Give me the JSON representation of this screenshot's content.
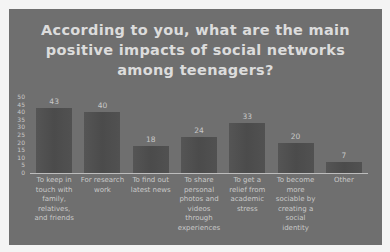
{
  "chart_data": {
    "type": "bar",
    "title": "According to you, what are the main positive impacts of social networks among teenagers?",
    "title_lines": [
      "According to you, what are the main",
      "positive impacts of social networks",
      "among teenagers?"
    ],
    "categories": [
      "To keep in touch with family, relatives, and friends",
      "For research work",
      "To find out latest news",
      "To share personal photos and videos through experiences",
      "To get a relief from academic stress",
      "To become more sociable by creating a social identity",
      "Other"
    ],
    "category_lines": [
      [
        "To keep in",
        "touch with",
        "family,",
        "relatives,",
        "and friends"
      ],
      [
        "For research",
        "work"
      ],
      [
        "To find out",
        "latest news"
      ],
      [
        "To share",
        "personal",
        "photos and",
        "videos",
        "through",
        "experiences"
      ],
      [
        "To get a",
        "relief from",
        "academic",
        "stress"
      ],
      [
        "To become",
        "more",
        "sociable by",
        "creating a",
        "social",
        "identity"
      ],
      [
        "Other"
      ]
    ],
    "values": [
      43,
      40,
      18,
      24,
      33,
      20,
      7
    ],
    "xlabel": "",
    "ylabel": "",
    "ylim": [
      0,
      50
    ],
    "yticks": [
      0,
      5,
      10,
      15,
      20,
      25,
      30,
      35,
      40,
      45,
      50
    ],
    "grid": false,
    "legend": null,
    "data_labels": true
  },
  "colors": {
    "background": "#6f6f6f",
    "bar": "#505050",
    "text": "#c8c8c8",
    "title": "#dcdcdc"
  }
}
